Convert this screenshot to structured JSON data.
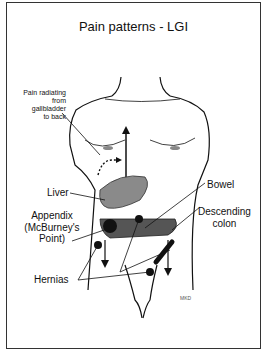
{
  "title": "Pain patterns - LGI",
  "labels": {
    "gallbladder": [
      "Pain radiating",
      "from gallbladder",
      "to back"
    ],
    "liver": "Liver",
    "bowel": "Bowel",
    "descending_colon": [
      "Descending",
      "colon"
    ],
    "appendix": [
      "Appendix",
      "(McBurney's",
      "Point)"
    ],
    "hernias": "Hernias"
  },
  "signature": "MKD",
  "colors": {
    "shading": "#7a7a7a",
    "dark": "#222222",
    "line": "#111111"
  }
}
